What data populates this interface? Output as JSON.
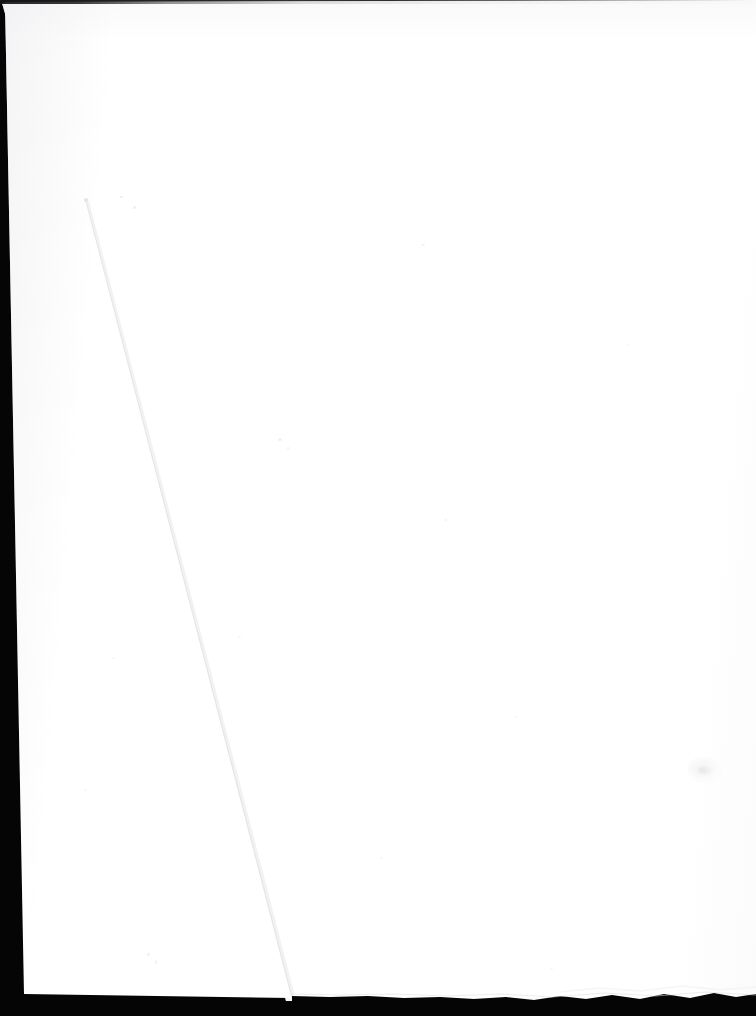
{
  "document": {
    "kind": "scanned-page",
    "title": "Blank scanned page",
    "page_content": "",
    "visible_text": "",
    "page_color": "#ffffff",
    "background_color": "#050505",
    "under_sheet_color": "#fdfdfd",
    "seam_color": "#e9e9ec",
    "notes": "Blank verso / flyleaf scanned on a dark platen; second sheet visible beneath along a diagonal edge."
  },
  "canvas": {
    "width": 756,
    "height": 1016
  },
  "top_sheet": {
    "label": "Top sheet",
    "corners": {
      "top_left": [
        5,
        2
      ],
      "top_right": [
        756,
        0
      ],
      "bottom_right": [
        292,
        997
      ],
      "bottom_left": [
        24,
        994
      ]
    }
  },
  "under_sheet": {
    "label": "Underlying sheet",
    "corners": {
      "top_left": [
        2,
        3
      ],
      "top_right": [
        756,
        1
      ],
      "bottom_right": [
        756,
        1003
      ],
      "bottom_left": [
        286,
        1001
      ]
    }
  },
  "seam": {
    "label": "Sheet edge seam",
    "start": [
      86,
      200
    ],
    "end": [
      292,
      997
    ]
  },
  "edges": {
    "top_scanline_label": "Top scan line",
    "left_band_label": "Left platen band",
    "bottom_band_label": "Bottom platen band",
    "deckle_label": "Deckled bottom-right edge"
  },
  "specks": [
    {
      "x": 120,
      "y": 196,
      "w": 3,
      "h": 2,
      "opacity": 0.16
    },
    {
      "x": 133,
      "y": 206,
      "w": 3,
      "h": 3,
      "opacity": 0.14
    },
    {
      "x": 278,
      "y": 438,
      "w": 4,
      "h": 3,
      "opacity": 0.12
    },
    {
      "x": 287,
      "y": 447,
      "w": 3,
      "h": 3,
      "opacity": 0.09
    },
    {
      "x": 421,
      "y": 244,
      "w": 4,
      "h": 2,
      "opacity": 0.11
    },
    {
      "x": 444,
      "y": 519,
      "w": 3,
      "h": 2,
      "opacity": 0.1
    },
    {
      "x": 238,
      "y": 636,
      "w": 3,
      "h": 2,
      "opacity": 0.09
    },
    {
      "x": 112,
      "y": 657,
      "w": 3,
      "h": 2,
      "opacity": 0.09
    },
    {
      "x": 84,
      "y": 789,
      "w": 3,
      "h": 2,
      "opacity": 0.08
    },
    {
      "x": 380,
      "y": 857,
      "w": 3,
      "h": 2,
      "opacity": 0.08
    },
    {
      "x": 514,
      "y": 716,
      "w": 3,
      "h": 2,
      "opacity": 0.07
    },
    {
      "x": 626,
      "y": 344,
      "w": 3,
      "h": 2,
      "opacity": 0.07
    },
    {
      "x": 147,
      "y": 953,
      "w": 3,
      "h": 3,
      "opacity": 0.13
    },
    {
      "x": 155,
      "y": 960,
      "w": 2,
      "h": 4,
      "opacity": 0.12
    },
    {
      "x": 550,
      "y": 968,
      "w": 3,
      "h": 2,
      "opacity": 0.09
    }
  ],
  "smudges": [
    {
      "x": 688,
      "y": 757,
      "w": 34,
      "h": 26,
      "opacity": 0.1,
      "label": "corner-smudge"
    },
    {
      "x": 697,
      "y": 766,
      "w": 16,
      "h": 10,
      "opacity": 0.12,
      "label": "corner-smudge-core"
    }
  ]
}
